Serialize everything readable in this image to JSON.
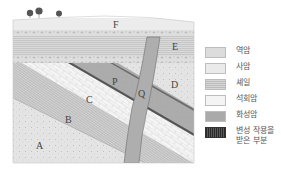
{
  "diagram": {
    "layer_labels": {
      "A": "A",
      "B": "B",
      "C": "C",
      "D": "D",
      "E": "E",
      "F": "F",
      "P": "P",
      "Q": "Q"
    }
  },
  "legend": {
    "items": [
      {
        "key": "conglomerate",
        "label": "역암"
      },
      {
        "key": "sandstone",
        "label": "사암"
      },
      {
        "key": "shale",
        "label": "셰일"
      },
      {
        "key": "limestone",
        "label": "석회암"
      },
      {
        "key": "igneous",
        "label": "화성암"
      },
      {
        "key": "metamorphosed",
        "label_line1": "변성 작용을",
        "label_line2": "받은 부분"
      }
    ]
  },
  "colors": {
    "igneous": "#a9a9a9",
    "sandstone": "#e6e6e6",
    "shale": "#d4d4d4",
    "limestone": "#f3f3f3",
    "metamorphosed": "#3a3a3a"
  }
}
